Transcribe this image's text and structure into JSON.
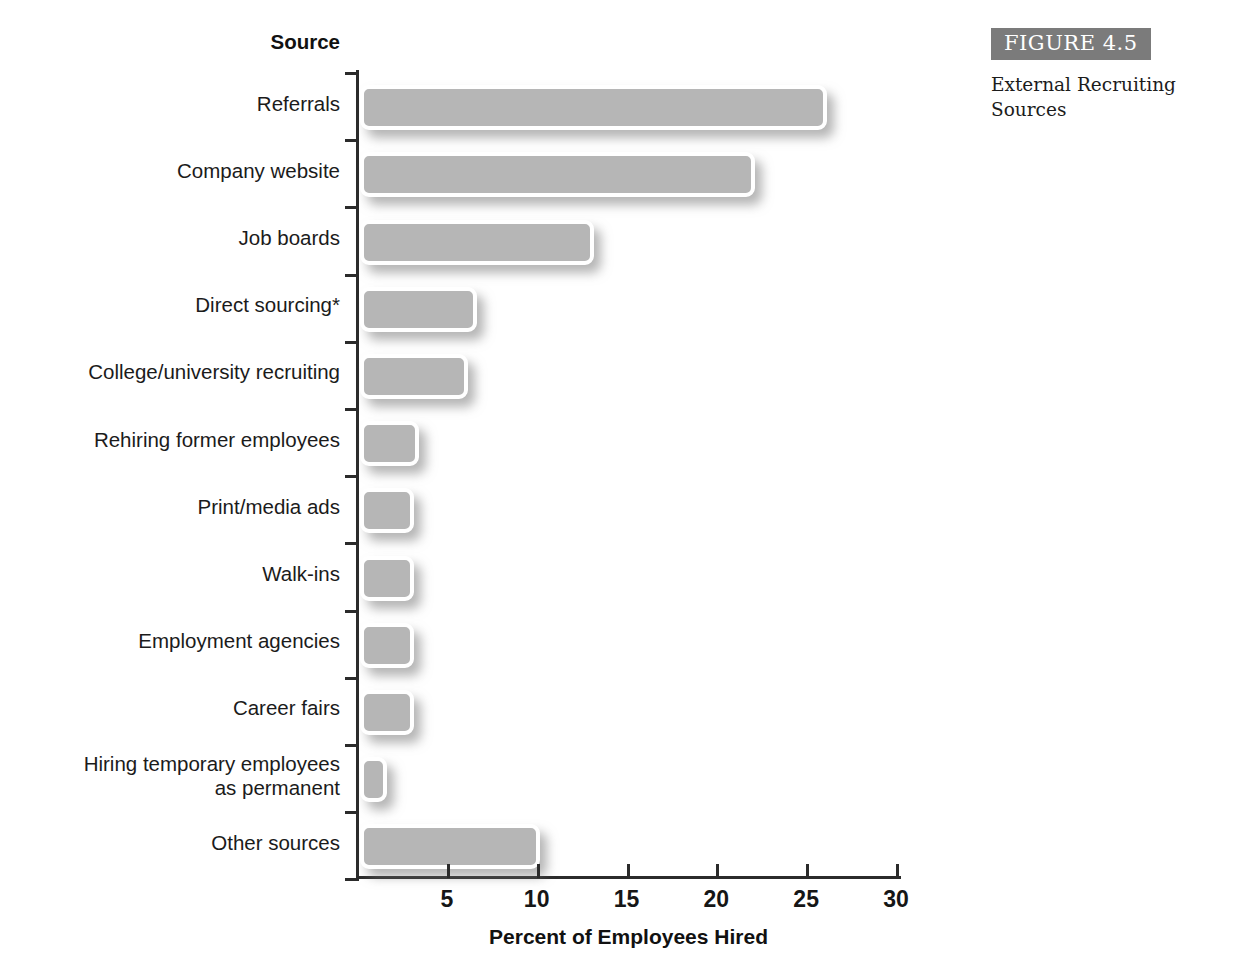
{
  "figure": {
    "badge_label": "FIGURE 4.5",
    "caption": "External Recruiting Sources",
    "badge_color": "#7b7b7b"
  },
  "chart_data": {
    "type": "bar",
    "orientation": "horizontal",
    "title": "",
    "xlabel": "Percent of Employees Hired",
    "ylabel": "Source",
    "xlim": [
      0,
      30
    ],
    "xticks": [
      5,
      10,
      15,
      20,
      25,
      30
    ],
    "grid": false,
    "legend": null,
    "bar_color": "#b6b6b6",
    "categories": [
      "Referrals",
      "Company website",
      "Job boards",
      "Direct sourcing*",
      "College/university recruiting",
      "Rehiring former employees",
      "Print/media ads",
      "Walk-ins",
      "Employment agencies",
      "Career fairs",
      "Hiring temporary employees\nas permanent",
      "Other sources"
    ],
    "values": [
      26,
      22,
      13,
      6.5,
      6,
      3.3,
      3,
      3,
      3,
      3,
      1.5,
      10
    ],
    "footnote": "*Direct sourcing"
  }
}
